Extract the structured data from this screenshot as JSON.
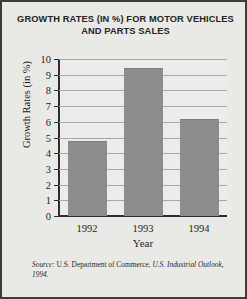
{
  "chart_data": {
    "type": "bar",
    "title": "GROWTH RATES (IN %) FOR MOTOR VEHICLES AND PARTS SALES",
    "title_line1": "GROWTH RATES (IN %) FOR MOTOR VEHICLES",
    "title_line2": "AND PARTS SALES",
    "categories": [
      "1992",
      "1993",
      "1994"
    ],
    "values": [
      4.8,
      9.4,
      6.2
    ],
    "xlabel": "Year",
    "ylabel": "Growth Rates (in %)",
    "ylim": [
      0,
      10
    ],
    "yticks": [
      "0",
      "1",
      "2",
      "3",
      "4",
      "5",
      "6",
      "7",
      "8",
      "9",
      "10"
    ],
    "grid": true,
    "legend": "none",
    "bar_color": "#8d8d8d",
    "plot_background": "#ececea",
    "axis_color": "#2e2e2e"
  },
  "source": {
    "prefix": "Source:",
    "publisher": " U.S. Department of Commerce, ",
    "title": "U.S. Industrial Outlook, 1994."
  }
}
